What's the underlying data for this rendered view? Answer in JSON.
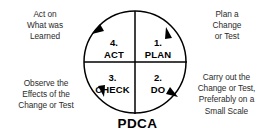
{
  "diagram": {
    "title": "PDCA",
    "type": "pdca-cycle",
    "center_label": "PDCA",
    "colors": {
      "stroke": "#000000",
      "text": "#2b2b2b",
      "label_text": "#000000",
      "background": "#ffffff"
    },
    "quadrants": [
      {
        "id": "plan",
        "number": "1.",
        "word": "PLAN",
        "position": "top-right"
      },
      {
        "id": "do",
        "number": "2.",
        "word": "DO",
        "position": "bottom-right"
      },
      {
        "id": "check",
        "number": "3.",
        "word": "CHECK",
        "position": "bottom-left"
      },
      {
        "id": "act",
        "number": "4.",
        "word": "ACT",
        "position": "top-left"
      }
    ],
    "annotations": [
      {
        "id": "act-on",
        "position": "top-left",
        "text": "Act on\nWhat was\nLearned"
      },
      {
        "id": "plan-a",
        "position": "top-right",
        "text": "Plan a\nChange\nor Test"
      },
      {
        "id": "observe",
        "position": "bottom-left",
        "text": "Observe the\nEffects of the\nChange or Test"
      },
      {
        "id": "carry-out",
        "position": "bottom-right",
        "text": "Carry out the\nChange or Test,\nPreferably on a\nSmall Scale"
      }
    ],
    "arrows": {
      "direction": "clockwise",
      "count": 4
    }
  }
}
